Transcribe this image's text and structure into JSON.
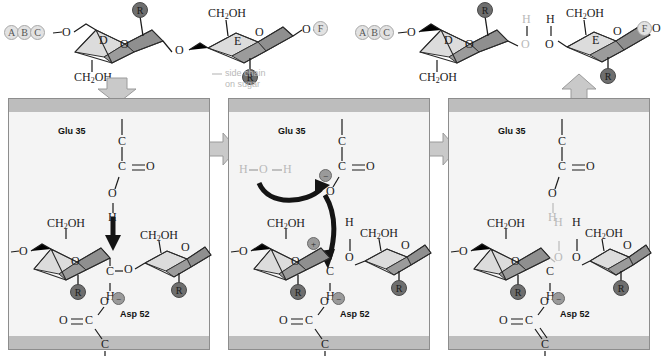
{
  "figure": {
    "type": "reaction-mechanism-diagram",
    "panel_count": 3
  },
  "colors": {
    "panel_background": "#f4f4f4",
    "panel_band": "#bdbdbd",
    "panel_border": "#8d8d8d",
    "sugar_ring_light": "#dcdcdc",
    "sugar_ring_mid": "#b0b0b0",
    "sugar_ring_dark": "#7d7d7d",
    "r_group_circle": "#6e6e6e",
    "letter_circle": "#e2e2e2",
    "charge_circle": "#9a9a9a",
    "arrow_gray": "#c6c6c6",
    "bond_black": "#1a1a1a",
    "faded_gray": "#b9b9b9"
  },
  "top_substrate": {
    "chain_labels": [
      "A",
      "B",
      "C"
    ],
    "terminal_label": "F",
    "sugar_d_label": "D",
    "sugar_e_label": "E",
    "atoms": {
      "ether_left": "O",
      "glycosidic_o": "O",
      "ring_o_d": "O",
      "ring_o_e": "O",
      "ether_right": "O",
      "ch2oh_d": "CH2OH",
      "ch2oh_e": "CH2OH"
    },
    "r_groups": [
      "R",
      "R"
    ],
    "annotation": {
      "line1": "side chain",
      "line2": "on sugar"
    }
  },
  "top_products": {
    "left_product": {
      "chain_labels": [
        "A",
        "B",
        "C"
      ],
      "sugar_label": "D",
      "ch2oh": "CH2OH",
      "ether_o": "O",
      "ring_o": "O",
      "hydroxyl_o": "O",
      "hydroxyl_h": "H",
      "r_group": "R"
    },
    "right_product": {
      "terminal_label": "F",
      "sugar_label": "E",
      "ch2oh": "CH2OH",
      "hydroxyl_h": "H",
      "hydroxyl_o": "O",
      "ring_o": "O",
      "ether_o": "O",
      "r_group": "R"
    }
  },
  "panels": [
    {
      "id": "panel-1",
      "step": 1,
      "glu_label": "Glu 35",
      "asp_label": "Asp 52",
      "glu_atoms": {
        "c_backbone": "C",
        "c_carboxyl": "C",
        "o_double": "O",
        "o_hydroxyl": "O",
        "h": "H"
      },
      "asp_atoms": {
        "o_double": "O",
        "c_carboxyl": "C",
        "o_minus": "O",
        "charge": "−",
        "c_backbone": "C"
      },
      "sugar_left": {
        "label": "",
        "ch2oh": "CH2OH",
        "ether_o": "O",
        "ring_o": "O",
        "c_anomeric": "C",
        "h": "H",
        "r_group": "R"
      },
      "sugar_right": {
        "ch2oh": "CH2OH",
        "ring_o": "O",
        "ether_o": "O",
        "r_group": "R"
      },
      "glycosidic_o": "O",
      "black_arrow": "proton-transfer-down"
    },
    {
      "id": "panel-2",
      "step": 2,
      "glu_label": "Glu 35",
      "asp_label": "Asp 52",
      "water": {
        "h_left": "H",
        "o": "O",
        "h_right": "H"
      },
      "glu_atoms": {
        "c_backbone": "C",
        "c_carboxyl": "C",
        "o_double": "O",
        "o_minus": "O",
        "charge": "−"
      },
      "asp_atoms": {
        "o_double": "O",
        "c_carboxyl": "C",
        "o_minus": "O",
        "charge": "−",
        "c_backbone": "C"
      },
      "sugar_left": {
        "ch2oh": "CH2OH",
        "ether_o": "O",
        "ring_o": "O",
        "charge": "+",
        "c_anomeric": "C",
        "h": "H",
        "r_group": "R"
      },
      "sugar_right": {
        "ch2oh": "CH2OH",
        "ring_o": "O",
        "ether_o": "O",
        "o_leaving": "O",
        "h_leaving": "H",
        "r_group": "R"
      },
      "curved_arrow": "water-attack"
    },
    {
      "id": "panel-3",
      "step": 3,
      "glu_label": "Glu 35",
      "asp_label": "Asp 52",
      "glu_atoms": {
        "c_backbone": "C",
        "c_carboxyl": "C",
        "o_double": "O",
        "o_hydroxyl": "O",
        "h": "H"
      },
      "asp_atoms": {
        "o_double": "O",
        "c_carboxyl": "C",
        "o_minus": "O",
        "charge": "−",
        "c_backbone": "C"
      },
      "sugar_left": {
        "ch2oh": "CH2OH",
        "ether_o": "O",
        "ring_o": "O",
        "c_anomeric": "C",
        "h": "H",
        "new_oh_h": "H",
        "new_oh_o": "O",
        "r_group": "R"
      },
      "sugar_right": {
        "ch2oh": "CH2OH",
        "ring_o": "O",
        "ether_o": "O",
        "oh_h": "H",
        "oh_o": "O",
        "r_group": "R"
      }
    }
  ],
  "flow_arrows": [
    {
      "name": "substrate-binding-arrow",
      "direction": "down"
    },
    {
      "name": "step1-to-step2-arrow",
      "direction": "right"
    },
    {
      "name": "step2-to-step3-arrow",
      "direction": "right"
    },
    {
      "name": "product-release-arrow",
      "direction": "up"
    }
  ]
}
